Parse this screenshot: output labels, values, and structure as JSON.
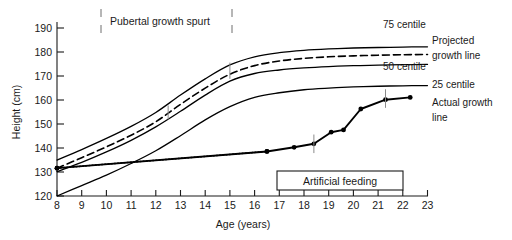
{
  "chart_data": {
    "type": "line",
    "title": "",
    "xlabel": "Age (years)",
    "ylabel": "Height (cm)",
    "xlim": [
      8,
      23
    ],
    "ylim": [
      120,
      195
    ],
    "xticks": [
      8,
      9,
      10,
      11,
      12,
      13,
      14,
      15,
      16,
      17,
      18,
      19,
      20,
      21,
      22,
      23
    ],
    "yticks": [
      120,
      130,
      140,
      150,
      160,
      170,
      180,
      190
    ],
    "grid": false,
    "legend_position": "right-inline",
    "series": [
      {
        "name": "75 centile",
        "style": "solid",
        "points": [
          [
            8,
            135.5
          ],
          [
            9,
            140.0
          ],
          [
            10,
            144.8
          ],
          [
            11,
            150.0
          ],
          [
            12,
            156.0
          ],
          [
            13,
            163.5
          ],
          [
            14,
            170.5
          ],
          [
            15,
            176.5
          ],
          [
            16,
            180.0
          ],
          [
            17,
            181.8
          ],
          [
            18,
            182.8
          ],
          [
            19,
            183.4
          ],
          [
            20,
            183.8
          ],
          [
            21,
            184.0
          ],
          [
            22,
            184.2
          ],
          [
            23,
            184.3
          ]
        ]
      },
      {
        "name": "Projected growth line",
        "style": "dashed",
        "points": [
          [
            8,
            132.0
          ],
          [
            9,
            136.5
          ],
          [
            10,
            141.2
          ],
          [
            11,
            146.2
          ],
          [
            12,
            152.0
          ],
          [
            13,
            159.5
          ],
          [
            14,
            166.5
          ],
          [
            15,
            172.5
          ],
          [
            16,
            176.2
          ],
          [
            17,
            178.2
          ],
          [
            18,
            179.3
          ],
          [
            19,
            180.0
          ],
          [
            20,
            180.4
          ],
          [
            21,
            180.7
          ],
          [
            22,
            180.9
          ],
          [
            23,
            181.0
          ]
        ]
      },
      {
        "name": "50 centile",
        "style": "solid",
        "points": [
          [
            8,
            130.5
          ],
          [
            9,
            134.5
          ],
          [
            10,
            139.0
          ],
          [
            11,
            144.0
          ],
          [
            12,
            149.8
          ],
          [
            13,
            156.5
          ],
          [
            14,
            163.5
          ],
          [
            15,
            169.5
          ],
          [
            16,
            172.8
          ],
          [
            17,
            174.3
          ],
          [
            18,
            175.2
          ],
          [
            19,
            175.8
          ],
          [
            20,
            176.2
          ],
          [
            21,
            176.4
          ],
          [
            22,
            176.6
          ],
          [
            23,
            176.7
          ]
        ]
      },
      {
        "name": "25 centile",
        "style": "solid",
        "points": [
          [
            8,
            120.0
          ],
          [
            9,
            124.5
          ],
          [
            10,
            129.0
          ],
          [
            11,
            134.0
          ],
          [
            12,
            139.5
          ],
          [
            13,
            146.0
          ],
          [
            14,
            152.8
          ],
          [
            15,
            158.5
          ],
          [
            16,
            162.5
          ],
          [
            17,
            164.5
          ],
          [
            18,
            165.8
          ],
          [
            19,
            166.5
          ],
          [
            20,
            167.0
          ],
          [
            21,
            167.3
          ],
          [
            22,
            167.5
          ],
          [
            23,
            167.6
          ]
        ]
      },
      {
        "name": "Actual growth line (projected segment)",
        "style": "dotted",
        "points": [
          [
            8,
            132.0
          ],
          [
            16.5,
            139.2
          ]
        ]
      },
      {
        "name": "Actual growth line",
        "style": "solid-markers",
        "points": [
          [
            8,
            132.0
          ],
          [
            16.5,
            139.2
          ],
          [
            17.6,
            141.0
          ],
          [
            18.4,
            142.5
          ],
          [
            19.1,
            147.5
          ],
          [
            19.6,
            148.5
          ],
          [
            20.3,
            157.5
          ],
          [
            21.3,
            161.5
          ],
          [
            22.3,
            162.5
          ]
        ]
      }
    ],
    "annotations": [
      {
        "name": "pubertal-growth-spurt",
        "text": "Pubertal growth spurt",
        "type": "bracketed-label",
        "x_start": 12.5,
        "x_end": 15.0
      },
      {
        "name": "artificial-feeding",
        "text": "Artificial feeding",
        "type": "box",
        "x_start": 17.0,
        "x_end": 22.0
      }
    ],
    "curve_markers": [
      {
        "x": 12.5,
        "y_low": 153.0,
        "y_high": 159.0
      },
      {
        "x": 15.0,
        "y_low": 170.5,
        "y_high": 177.5
      },
      {
        "x": 18.4,
        "y_low": 138.5,
        "y_high": 146.5
      },
      {
        "x": 21.3,
        "y_low": 158.0,
        "y_high": 166.0
      }
    ]
  },
  "axes": {
    "y_title": "Height (cm)",
    "x_title": "Age (years)",
    "y_tick_labels": [
      "190",
      "180",
      "170",
      "160",
      "150",
      "140",
      "130",
      "120"
    ],
    "x_tick_labels": [
      "8",
      "9",
      "10",
      "11",
      "12",
      "13",
      "14",
      "15",
      "16",
      "17",
      "18",
      "19",
      "20",
      "21",
      "22",
      "23"
    ]
  },
  "series_labels": {
    "centile_75": "75 centile",
    "centile_50": "50 centile",
    "centile_25": "25 centile",
    "projected_line_1": "Projected",
    "projected_line_2": "growth line",
    "actual_line_1": "Actual growth",
    "actual_line_2": "line"
  },
  "annotations": {
    "pubertal": "Pubertal growth spurt",
    "artificial_feeding": "Artificial feeding"
  },
  "colors": {
    "ink": "#1a1a1a",
    "line": "#000000",
    "marker_grey": "#8a8a8a",
    "background": "#ffffff"
  }
}
